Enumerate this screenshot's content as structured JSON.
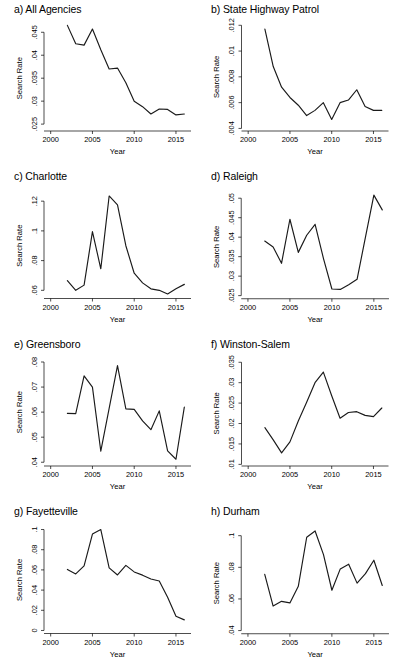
{
  "figure": {
    "panel_label_prefixes": [
      "a)",
      "b)",
      "c)",
      "d)",
      "e)",
      "f)",
      "g)",
      "h)"
    ],
    "shared_xlabel": "Year",
    "shared_ylabel": "Search Rate",
    "line_color": "#1a1a1a"
  },
  "chart_data": [
    {
      "type": "line",
      "title": "a) All Agencies",
      "xlabel": "Year",
      "ylabel": "Search Rate",
      "xlim": [
        1999.2,
        2016.8
      ],
      "ylim": [
        0.0235,
        0.0468
      ],
      "xticks": [
        2000,
        2005,
        2010,
        2015
      ],
      "yticks": [
        0.025,
        0.03,
        0.035,
        0.04,
        0.045
      ],
      "ytick_labels": [
        ".025",
        ".03",
        ".035",
        ".04",
        ".045"
      ],
      "grid": false,
      "legend": "none",
      "x": [
        2002,
        2003,
        2004,
        2005,
        2006,
        2007,
        2008,
        2009,
        2010,
        2011,
        2012,
        2013,
        2014,
        2015,
        2016
      ],
      "values": [
        0.0465,
        0.0425,
        0.0422,
        0.0457,
        0.0412,
        0.037,
        0.0372,
        0.034,
        0.03,
        0.0288,
        0.0272,
        0.0283,
        0.0282,
        0.027,
        0.0272
      ]
    },
    {
      "type": "line",
      "title": "b) State Highway Patrol",
      "xlabel": "Year",
      "ylabel": "Search Rate",
      "xlim": [
        1999.2,
        2016.8
      ],
      "ylim": [
        0.0038,
        0.0121
      ],
      "xticks": [
        2000,
        2005,
        2010,
        2015
      ],
      "yticks": [
        0.004,
        0.006,
        0.008,
        0.01,
        0.012
      ],
      "ytick_labels": [
        ".004",
        ".006",
        ".008",
        ".01",
        ".012"
      ],
      "grid": false,
      "legend": "none",
      "x": [
        2002,
        2003,
        2004,
        2005,
        2006,
        2007,
        2008,
        2009,
        2010,
        2011,
        2012,
        2013,
        2014,
        2015,
        2016
      ],
      "values": [
        0.0117,
        0.0088,
        0.0072,
        0.0064,
        0.0058,
        0.005,
        0.0054,
        0.006,
        0.0047,
        0.006,
        0.0062,
        0.007,
        0.0057,
        0.0054,
        0.0054
      ]
    },
    {
      "type": "line",
      "title": "c) Charlotte",
      "xlabel": "Year",
      "ylabel": "Search Rate",
      "xlim": [
        1999.2,
        2016.8
      ],
      "ylim": [
        0.0545,
        0.1265
      ],
      "xticks": [
        2000,
        2005,
        2010,
        2015
      ],
      "yticks": [
        0.06,
        0.08,
        0.1,
        0.12
      ],
      "ytick_labels": [
        ".06",
        ".08",
        ".1",
        ".12"
      ],
      "grid": false,
      "legend": "none",
      "x": [
        2002,
        2003,
        2004,
        2005,
        2006,
        2007,
        2008,
        2009,
        2010,
        2011,
        2012,
        2013,
        2014,
        2015,
        2016
      ],
      "values": [
        0.0665,
        0.06,
        0.0635,
        0.0995,
        0.0745,
        0.1235,
        0.1175,
        0.09,
        0.0715,
        0.065,
        0.061,
        0.06,
        0.0575,
        0.061,
        0.064
      ]
    },
    {
      "type": "line",
      "title": "d) Raleigh",
      "xlabel": "Year",
      "ylabel": "Search Rate",
      "xlim": [
        1999.2,
        2016.8
      ],
      "ylim": [
        0.0242,
        0.0518
      ],
      "xticks": [
        2000,
        2005,
        2010,
        2015
      ],
      "yticks": [
        0.025,
        0.03,
        0.035,
        0.04,
        0.045,
        0.05
      ],
      "ytick_labels": [
        ".025",
        ".03",
        ".035",
        ".04",
        ".045",
        ".05"
      ],
      "grid": false,
      "legend": "none",
      "x": [
        2002,
        2003,
        2004,
        2005,
        2006,
        2007,
        2008,
        2009,
        2010,
        2011,
        2012,
        2013,
        2014,
        2015,
        2016
      ],
      "values": [
        0.039,
        0.0375,
        0.0333,
        0.0446,
        0.0361,
        0.0405,
        0.0433,
        0.0345,
        0.0267,
        0.0266,
        0.0278,
        0.0292,
        0.04,
        0.0508,
        0.047
      ]
    },
    {
      "type": "line",
      "title": "e) Greensboro",
      "xlabel": "Year",
      "ylabel": "Search Rate",
      "xlim": [
        1999.2,
        2016.8
      ],
      "ylim": [
        0.0385,
        0.0812
      ],
      "xticks": [
        2000,
        2005,
        2010,
        2015
      ],
      "yticks": [
        0.04,
        0.05,
        0.06,
        0.07,
        0.08
      ],
      "ytick_labels": [
        ".04",
        ".05",
        ".06",
        ".07",
        ".08"
      ],
      "grid": false,
      "legend": "none",
      "x": [
        2002,
        2003,
        2004,
        2005,
        2006,
        2007,
        2008,
        2009,
        2010,
        2011,
        2012,
        2013,
        2014,
        2015,
        2016
      ],
      "values": [
        0.0595,
        0.0594,
        0.0745,
        0.07,
        0.0444,
        0.0615,
        0.0786,
        0.0613,
        0.0611,
        0.0565,
        0.053,
        0.0605,
        0.0445,
        0.0412,
        0.062
      ]
    },
    {
      "type": "line",
      "title": "f) Winston-Salem",
      "xlabel": "Year",
      "ylabel": "Search Rate",
      "xlim": [
        1999.2,
        2016.8
      ],
      "ylim": [
        0.0096,
        0.0358
      ],
      "xticks": [
        2000,
        2005,
        2010,
        2015
      ],
      "yticks": [
        0.01,
        0.015,
        0.02,
        0.025,
        0.03,
        0.035
      ],
      "ytick_labels": [
        ".01",
        ".015",
        ".02",
        ".025",
        ".03",
        ".035"
      ],
      "grid": false,
      "legend": "none",
      "x": [
        2002,
        2003,
        2004,
        2005,
        2006,
        2007,
        2008,
        2009,
        2010,
        2011,
        2012,
        2013,
        2014,
        2015,
        2016
      ],
      "values": [
        0.019,
        0.016,
        0.0128,
        0.0155,
        0.0206,
        0.0252,
        0.03,
        0.0326,
        0.0268,
        0.0213,
        0.0227,
        0.0229,
        0.022,
        0.0217,
        0.0238
      ]
    },
    {
      "type": "line",
      "title": "g) Fayetteville",
      "xlabel": "Year",
      "ylabel": "Search Rate",
      "xlim": [
        1999.2,
        2016.8
      ],
      "ylim": [
        -0.003,
        0.103
      ],
      "xticks": [
        2000,
        2005,
        2010,
        2015
      ],
      "yticks": [
        0,
        0.02,
        0.04,
        0.06,
        0.08,
        0.1
      ],
      "ytick_labels": [
        "0",
        ".02",
        ".04",
        ".06",
        ".08",
        ".1"
      ],
      "grid": false,
      "legend": "none",
      "x": [
        2002,
        2003,
        2004,
        2005,
        2006,
        2007,
        2008,
        2009,
        2010,
        2011,
        2012,
        2013,
        2014,
        2015,
        2016
      ],
      "values": [
        0.0605,
        0.056,
        0.064,
        0.0955,
        0.1,
        0.062,
        0.055,
        0.0645,
        0.058,
        0.0548,
        0.051,
        0.049,
        0.033,
        0.014,
        0.0105
      ]
    },
    {
      "type": "line",
      "title": "h) Durham",
      "xlabel": "Year",
      "ylabel": "Search Rate",
      "xlim": [
        1999.2,
        2016.8
      ],
      "ylim": [
        0.038,
        0.106
      ],
      "xticks": [
        2000,
        2005,
        2010,
        2015
      ],
      "yticks": [
        0.04,
        0.06,
        0.08,
        0.1
      ],
      "ytick_labels": [
        ".04",
        ".06",
        ".08",
        ".1"
      ],
      "grid": false,
      "legend": "none",
      "x": [
        2002,
        2003,
        2004,
        2005,
        2006,
        2007,
        2008,
        2009,
        2010,
        2011,
        2012,
        2013,
        2014,
        2015,
        2016
      ],
      "values": [
        0.0755,
        0.0555,
        0.0585,
        0.0575,
        0.068,
        0.099,
        0.103,
        0.088,
        0.0655,
        0.079,
        0.082,
        0.07,
        0.076,
        0.0845,
        0.0685
      ]
    }
  ]
}
